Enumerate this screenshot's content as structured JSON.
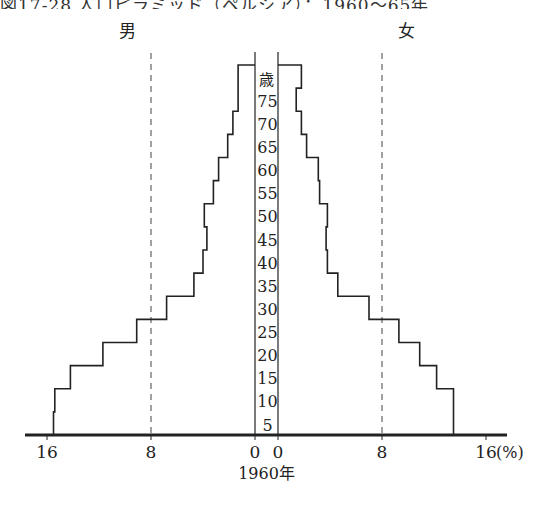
{
  "title": "図17-28 人口ピラミッド（ペルシア）：1960〜65年",
  "chart_data": {
    "type": "bar",
    "subtype": "population-pyramid",
    "title": "図17-28 人口ピラミッド（ペルシア）：1960〜65年",
    "year_label": "1960年",
    "unit_label": "(%)",
    "left_label": "男",
    "right_label": "女",
    "age_unit_label": "歳",
    "categories": [
      "0-4",
      "5-9",
      "10-14",
      "15-19",
      "20-24",
      "25-29",
      "30-34",
      "35-39",
      "40-44",
      "45-49",
      "50-54",
      "55-59",
      "60-64",
      "65-69",
      "70-74",
      "75+"
    ],
    "age_tick_labels": [
      "5",
      "10",
      "15",
      "20",
      "25",
      "30",
      "35",
      "40",
      "45",
      "50",
      "55",
      "60",
      "65",
      "70",
      "75"
    ],
    "series": [
      {
        "name": "男",
        "side": "left",
        "values": [
          15.5,
          15.4,
          14.2,
          11.7,
          9.1,
          6.8,
          4.7,
          4.0,
          3.7,
          3.9,
          3.2,
          2.8,
          2.1,
          1.7,
          1.3,
          1.3
        ]
      },
      {
        "name": "女",
        "side": "right",
        "values": [
          13.5,
          13.5,
          12.2,
          10.9,
          9.3,
          7.0,
          4.6,
          3.8,
          3.7,
          3.8,
          3.2,
          3.1,
          2.2,
          1.8,
          1.4,
          1.8
        ]
      }
    ],
    "x_ticks": [
      16,
      8,
      0
    ],
    "x_tick_labels_left": [
      "16",
      "8",
      "0"
    ],
    "x_tick_labels_right": [
      "0",
      "8",
      "16"
    ],
    "reference_lines_pct": [
      8
    ],
    "xlim": [
      0,
      18
    ],
    "grid": false,
    "legend": "none"
  },
  "colors": {
    "line": "#222222",
    "dashed": "#444444"
  }
}
